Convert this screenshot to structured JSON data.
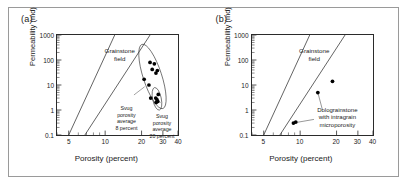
{
  "figure": {
    "panels": [
      {
        "id": "a",
        "label": "(a)",
        "field_label": "Grainstone\nfield",
        "annotations": [
          {
            "name": "svug-8",
            "text": "Svug\nporosity\naverage\n8 percent"
          },
          {
            "name": "svug-20",
            "text": "Svug\nporosity\naverage\n20 percent"
          }
        ]
      },
      {
        "id": "b",
        "label": "(b)",
        "field_label": "Grainstone\nfield",
        "annotations": [
          {
            "name": "dolograinstone",
            "text": "Dolograinstone\nwith intragrain\nmicroporosity"
          }
        ]
      }
    ]
  },
  "chart_data": [
    {
      "type": "scatter",
      "panel": "a",
      "title": "(a)",
      "xlabel": "Porosity (percent)",
      "ylabel": "Permeability (md)",
      "xscale": "log",
      "yscale": "log",
      "xlim": [
        4,
        40
      ],
      "ylim": [
        0.1,
        1000
      ],
      "xticks": [
        5,
        10,
        20,
        30,
        40
      ],
      "xticklabels": [
        "5",
        "10",
        "20",
        "30",
        "40"
      ],
      "yticks": [
        0.1,
        1,
        10,
        100,
        1000
      ],
      "yticklabels": [
        "0.1",
        "1",
        "10",
        "100",
        "1000"
      ],
      "grid": false,
      "legend": false,
      "series": [
        {
          "name": "Svug porosity average 8 percent",
          "marker": "circle",
          "points": [
            {
              "x": 23.5,
              "y": 80
            },
            {
              "x": 25.5,
              "y": 70
            },
            {
              "x": 24.5,
              "y": 42
            },
            {
              "x": 27.0,
              "y": 38
            },
            {
              "x": 26.3,
              "y": 30
            },
            {
              "x": 21.0,
              "y": 17
            },
            {
              "x": 23.0,
              "y": 10
            },
            {
              "x": 23.8,
              "y": 3.0
            }
          ]
        },
        {
          "name": "Svug porosity average 20 percent",
          "marker": "circle",
          "points": [
            {
              "x": 27.5,
              "y": 4.2
            },
            {
              "x": 26.2,
              "y": 3.0
            },
            {
              "x": 26.8,
              "y": 2.6
            },
            {
              "x": 27.2,
              "y": 2.2
            },
            {
              "x": 26.4,
              "y": 2.0
            }
          ]
        }
      ],
      "boundary_lines": [
        {
          "name": "grainstone-field-left",
          "x1": 5.0,
          "y1": 0.1,
          "x2": 12.0,
          "y2": 1000
        },
        {
          "name": "grainstone-field-right",
          "x1": 6.8,
          "y1": 0.1,
          "x2": 23.5,
          "y2": 1000
        }
      ],
      "envelopes": [
        {
          "name": "svug-8-envelope",
          "cx": 24.6,
          "cy": 22,
          "rx": 4.3,
          "ry": 1.35,
          "rot": -18
        },
        {
          "name": "svug-20-envelope",
          "cx": 26.8,
          "cy": 2.8,
          "rx": 2.2,
          "ry": 0.46,
          "rot": -12
        }
      ]
    },
    {
      "type": "scatter",
      "panel": "b",
      "title": "(b)",
      "xlabel": "Porosity (percent)",
      "ylabel": "Permeability (md)",
      "xscale": "log",
      "yscale": "log",
      "xlim": [
        4,
        40
      ],
      "ylim": [
        0.1,
        1000
      ],
      "xticks": [
        5,
        10,
        20,
        30,
        40
      ],
      "xticklabels": [
        "5",
        "10",
        "20",
        "30",
        "40"
      ],
      "yticks": [
        0.1,
        1,
        10,
        100,
        1000
      ],
      "yticklabels": [
        "0.1",
        "1",
        "10",
        "100",
        "1000"
      ],
      "grid": false,
      "legend": false,
      "series": [
        {
          "name": "Dolograinstone with intragrain microporosity",
          "marker": "circle",
          "points": [
            {
              "x": 18.5,
              "y": 14
            },
            {
              "x": 14.0,
              "y": 5.0
            },
            {
              "x": 9.2,
              "y": 0.33
            },
            {
              "x": 8.8,
              "y": 0.3
            }
          ]
        }
      ],
      "boundary_lines": [
        {
          "name": "grainstone-field-left",
          "x1": 5.0,
          "y1": 0.1,
          "x2": 12.0,
          "y2": 1000
        },
        {
          "name": "grainstone-field-right",
          "x1": 6.8,
          "y1": 0.1,
          "x2": 23.5,
          "y2": 1000
        }
      ],
      "leader_lines": [
        {
          "name": "leader-to-point-mid",
          "x1": 14.0,
          "y1": 5.0,
          "x2": 15.3,
          "y2": 1.0
        },
        {
          "name": "leader-to-point-low",
          "x1": 9.4,
          "y1": 0.32,
          "x2": 13.0,
          "y2": 0.42
        }
      ]
    }
  ]
}
